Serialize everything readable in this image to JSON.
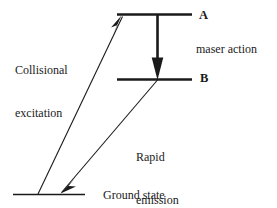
{
  "figure": {
    "kind": "energy-level-diagram",
    "background_color": "#ffffff",
    "stroke_color": "#1a1a1a"
  },
  "levels": {
    "upper": {
      "label": "A",
      "line_y": 14,
      "line_x1": 117,
      "line_x2": 192
    },
    "lower": {
      "label": "B",
      "line_y": 79,
      "line_x1": 117,
      "line_x2": 192
    },
    "ground": {
      "label": "Ground state",
      "line_y": 194,
      "line_x1": 13,
      "line_x2": 85
    }
  },
  "transitions": {
    "collisional": {
      "label_line1": "Collisional",
      "label_line2": "excitation",
      "from_x": 38,
      "from_y": 194,
      "to_x": 121,
      "to_y": 17,
      "arrow": "up"
    },
    "maser": {
      "label": "maser action",
      "from_x": 157,
      "from_y": 15,
      "to_x": 157,
      "to_y": 79,
      "arrow": "down"
    },
    "rapid": {
      "label_line1": "Rapid",
      "label_line2": "emission",
      "from_x": 157,
      "from_y": 80,
      "to_x": 62,
      "to_y": 192,
      "arrow": "down"
    }
  }
}
